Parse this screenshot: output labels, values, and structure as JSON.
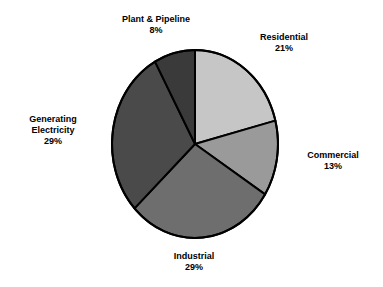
{
  "chart_data": {
    "type": "pie",
    "title": "",
    "subtitle": "",
    "xlabel": "",
    "ylabel": "",
    "legend_position": "none",
    "grid": false,
    "units": "percent",
    "total": 100,
    "start_angle_deg": 0,
    "direction": "clockwise",
    "categories": [
      "Residential",
      "Commercial",
      "Industrial",
      "Generating Electricity",
      "Plant & Pipeline"
    ],
    "values": [
      21,
      13,
      29,
      29,
      8
    ],
    "slices": [
      {
        "label": "Residential",
        "label_line1": "Residential",
        "label_line2": "",
        "value": 21,
        "value_text": "21%",
        "color": "#c6c6c6"
      },
      {
        "label": "Commercial",
        "label_line1": "Commercial",
        "label_line2": "",
        "value": 13,
        "value_text": "13%",
        "color": "#9a9a9a"
      },
      {
        "label": "Industrial",
        "label_line1": "Industrial",
        "label_line2": "",
        "value": 29,
        "value_text": "29%",
        "color": "#6e6e6e"
      },
      {
        "label": "Generating Electricity",
        "label_line1": "Generating",
        "label_line2": "Electricity",
        "value": 29,
        "value_text": "29%",
        "color": "#4a4a4a"
      },
      {
        "label": "Plant & Pipeline",
        "label_line1": "Plant & Pipeline",
        "label_line2": "",
        "value": 8,
        "value_text": "8%",
        "color": "#3a3a3a"
      }
    ]
  },
  "geometry": {
    "center_x": 195,
    "center_y": 144,
    "radius_x": 83,
    "radius_y": 94,
    "outline_color": "#000000",
    "outline_width": 2,
    "background": "#ffffff"
  }
}
